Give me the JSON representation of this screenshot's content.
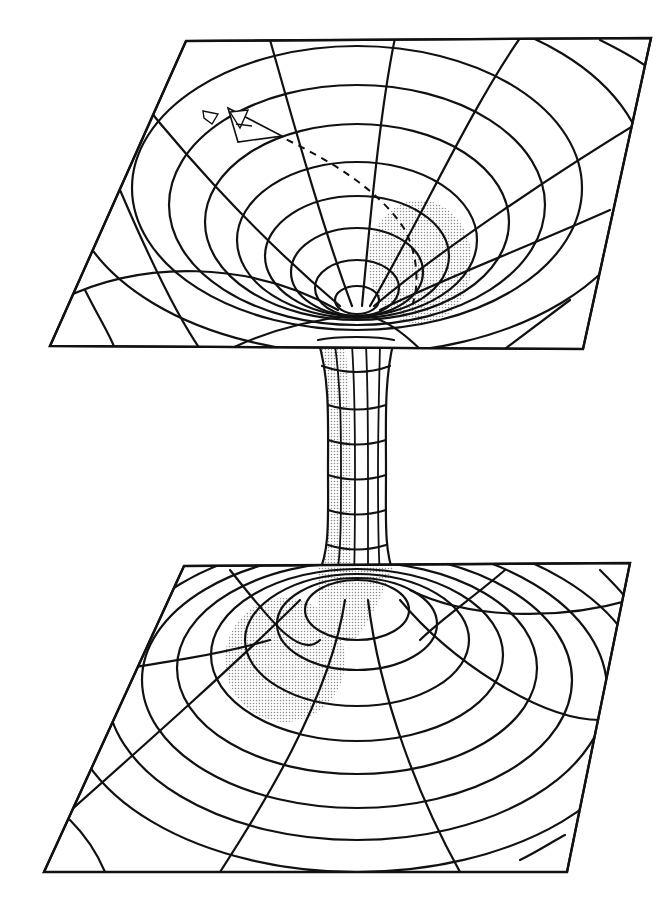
{
  "figure": {
    "title": "",
    "colors": {
      "line": "#111111",
      "background": "#ffffff",
      "stipple": "#9a9a9a"
    },
    "elements": {
      "upper_sheet": {
        "label": "",
        "rings": 8,
        "spokes": 8
      },
      "throat": {
        "label": "",
        "rings": 7,
        "meridians": 6
      },
      "lower_sheet": {
        "label": "",
        "rings": 8,
        "spokes": 8
      },
      "spacecraft": {
        "label": "",
        "icon": "spaceship-icon"
      },
      "trajectory": {
        "label": "",
        "style": "dashed"
      }
    }
  }
}
